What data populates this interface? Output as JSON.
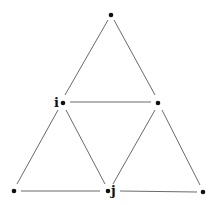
{
  "diagram": {
    "type": "graph",
    "nodes": [
      {
        "id": "top",
        "label": "",
        "x": 111,
        "y": 15
      },
      {
        "id": "i",
        "label": "i",
        "x": 62,
        "y": 103
      },
      {
        "id": "mid_right",
        "label": "",
        "x": 158,
        "y": 103
      },
      {
        "id": "bottom_left",
        "label": "",
        "x": 14,
        "y": 191
      },
      {
        "id": "j",
        "label": "j",
        "x": 108,
        "y": 191
      },
      {
        "id": "bottom_right",
        "label": "",
        "x": 203,
        "y": 192
      }
    ],
    "edges": [
      {
        "from": "top",
        "to": "i"
      },
      {
        "from": "top",
        "to": "mid_right"
      },
      {
        "from": "i",
        "to": "mid_right"
      },
      {
        "from": "i",
        "to": "bottom_left"
      },
      {
        "from": "i",
        "to": "j"
      },
      {
        "from": "mid_right",
        "to": "j"
      },
      {
        "from": "mid_right",
        "to": "bottom_right"
      },
      {
        "from": "bottom_left",
        "to": "j"
      },
      {
        "from": "j",
        "to": "bottom_right"
      }
    ],
    "labels": {
      "i": "i",
      "j": "j"
    }
  }
}
